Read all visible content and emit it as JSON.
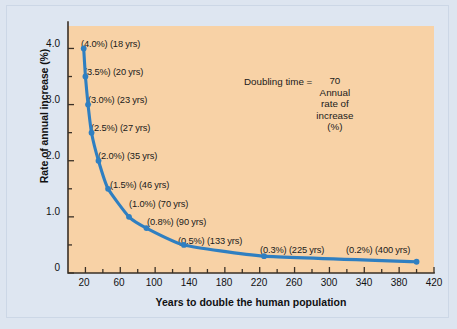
{
  "chart_data": {
    "type": "line",
    "title": "",
    "xlabel": "Years to double the human population",
    "ylabel": "Rate of annual increase (%)",
    "xlim": [
      0,
      420
    ],
    "ylim": [
      0,
      4.4
    ],
    "grid": false,
    "legend": "none",
    "x": [
      18,
      20,
      23,
      27,
      35,
      46,
      70,
      90,
      133,
      225,
      400
    ],
    "y": [
      4.0,
      3.5,
      3.0,
      2.5,
      2.0,
      1.5,
      1.0,
      0.8,
      0.5,
      0.3,
      0.2
    ],
    "series": [
      {
        "name": "Doubling time curve",
        "values": [
          4.0,
          3.5,
          3.0,
          2.5,
          2.0,
          1.5,
          1.0,
          0.8,
          0.5,
          0.3,
          0.2
        ]
      }
    ],
    "point_labels": [
      "(4.0%) (18 yrs)",
      "(3.5%) (20 yrs)",
      "(3.0%) (23 yrs)",
      "(2.5%) (27 yrs)",
      "(2.0%) (35 yrs)",
      "(1.5%) (46 yrs)",
      "(1.0%) (70 yrs)",
      "(0.8%) (90 yrs)",
      "(0.5%) (133 yrs)",
      "(0.3%) (225 yrs)",
      "(0.2%) (400 yrs)"
    ],
    "xticks": [
      20,
      60,
      100,
      140,
      180,
      220,
      260,
      300,
      340,
      380,
      420
    ],
    "xtick_labels": [
      "20",
      "60",
      "100",
      "140",
      "180",
      "220",
      "260",
      "300",
      "340",
      "380",
      "420"
    ],
    "xminor_step": 20,
    "yticks": [
      0,
      1.0,
      2.0,
      3.0,
      4.0
    ],
    "ytick_labels": [
      "0",
      "1.0",
      "2.0",
      "3.0",
      "4.0"
    ],
    "yminor": [
      0.5,
      1.5,
      2.5,
      3.5
    ],
    "annotation": {
      "lhs": "Doubling time =",
      "numerator": "70",
      "denominator_lines": [
        "Annual",
        "rate of",
        "increase",
        "(%)"
      ]
    },
    "colors": {
      "curve": "#2f7fc1",
      "marker": "#2f7fc1",
      "plot_background": "#f8d2a6",
      "figure_background": "#dee6f1",
      "axis": "#3a3026",
      "text": "#1a1a1a"
    }
  }
}
